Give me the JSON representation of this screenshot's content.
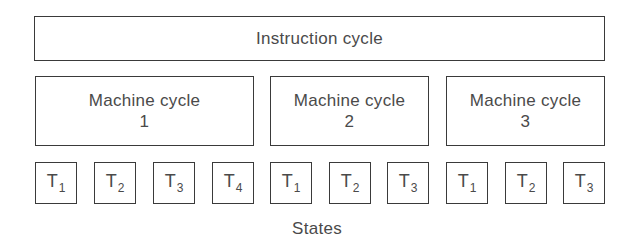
{
  "diagram": {
    "instruction_cycle": {
      "label": "Instruction cycle"
    },
    "machine_cycles": [
      {
        "label": "Machine cycle",
        "number": "1"
      },
      {
        "label": "Machine cycle",
        "number": "2"
      },
      {
        "label": "Machine cycle",
        "number": "3"
      }
    ],
    "states": [
      {
        "base": "T",
        "sub": "1",
        "machine_cycle": "1"
      },
      {
        "base": "T",
        "sub": "2",
        "machine_cycle": "1"
      },
      {
        "base": "T",
        "sub": "3",
        "machine_cycle": "1"
      },
      {
        "base": "T",
        "sub": "4",
        "machine_cycle": "1"
      },
      {
        "base": "T",
        "sub": "1",
        "machine_cycle": "2"
      },
      {
        "base": "T",
        "sub": "2",
        "machine_cycle": "2"
      },
      {
        "base": "T",
        "sub": "3",
        "machine_cycle": "2"
      },
      {
        "base": "T",
        "sub": "1",
        "machine_cycle": "3"
      },
      {
        "base": "T",
        "sub": "2",
        "machine_cycle": "3"
      },
      {
        "base": "T",
        "sub": "3",
        "machine_cycle": "3"
      }
    ],
    "states_label": "States"
  },
  "colors": {
    "border": "#3a3a3a",
    "text": "#4a4a4a",
    "background": "#ffffff"
  }
}
